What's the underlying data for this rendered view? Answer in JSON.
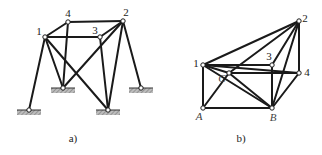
{
  "figure_a": {
    "caption": "a)",
    "nodes": {
      "1": {
        "label": "1",
        "x": 45,
        "y": 37
      },
      "4": {
        "label": "4",
        "x": 68,
        "y": 22
      },
      "2": {
        "label": "2",
        "x": 123,
        "y": 21
      },
      "3": {
        "label": "3",
        "x": 100,
        "y": 37
      },
      "s1": {
        "label": "",
        "x": 29,
        "y": 110
      },
      "s2": {
        "label": "",
        "x": 63,
        "y": 88
      },
      "s3": {
        "label": "",
        "x": 108,
        "y": 110
      },
      "s4": {
        "label": "",
        "x": 141,
        "y": 88
      }
    },
    "members": [
      [
        "1",
        "4"
      ],
      [
        "4",
        "2"
      ],
      [
        "1",
        "3"
      ],
      [
        "3",
        "2"
      ],
      [
        "1",
        "s1"
      ],
      [
        "1",
        "s2"
      ],
      [
        "1",
        "s3"
      ],
      [
        "4",
        "s2"
      ],
      [
        "2",
        "s2"
      ],
      [
        "2",
        "s3"
      ],
      [
        "3",
        "s3"
      ],
      [
        "2",
        "s4"
      ]
    ],
    "supports": [
      "s1",
      "s2",
      "s3",
      "s4"
    ]
  },
  "figure_b": {
    "caption": "b)",
    "nodes": {
      "1": {
        "label": "1",
        "x": 203,
        "y": 65
      },
      "2": {
        "label": "2",
        "x": 299,
        "y": 21
      },
      "3": {
        "label": "3",
        "x": 272,
        "y": 65
      },
      "4": {
        "label": "4",
        "x": 299,
        "y": 73
      },
      "C": {
        "label": "C",
        "x": 229,
        "y": 73
      },
      "A": {
        "label": "A",
        "x": 203,
        "y": 108
      },
      "B": {
        "label": "B",
        "x": 272,
        "y": 108
      }
    },
    "members": [
      [
        "1",
        "2"
      ],
      [
        "1",
        "3"
      ],
      [
        "1",
        "A"
      ],
      [
        "1",
        "B"
      ],
      [
        "1",
        "C"
      ],
      [
        "C",
        "4"
      ],
      [
        "C",
        "2"
      ],
      [
        "C",
        "B"
      ],
      [
        "A",
        "C"
      ],
      [
        "A",
        "B"
      ],
      [
        "3",
        "B"
      ],
      [
        "2",
        "B"
      ],
      [
        "2",
        "4"
      ],
      [
        "4",
        "B"
      ],
      [
        "2",
        "3"
      ],
      [
        "1",
        "4"
      ]
    ]
  }
}
